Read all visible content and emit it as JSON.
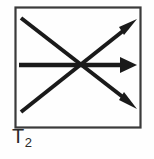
{
  "figure": {
    "title": "T2",
    "label": {
      "base": "T",
      "subscript": "2",
      "full": "T2"
    },
    "colors": {
      "ink": "#1a1a1a",
      "frame": "#3a3a3a",
      "background": "#fefefe",
      "label": "#2a2a2a"
    },
    "frame": {
      "x": 15,
      "y": 7,
      "width": 126,
      "height": 121,
      "stroke_width": 2.2
    },
    "convergence_point": {
      "x": 78,
      "y": 65
    },
    "arrows": [
      {
        "name": "arrow-up-right",
        "direction": "up-right",
        "x1": 21,
        "y1": 112,
        "x2": 136,
        "y2": 20,
        "head": "filled-triangle"
      },
      {
        "name": "arrow-right",
        "direction": "right",
        "x1": 19,
        "y1": 65,
        "x2": 137,
        "y2": 65,
        "head": "filled-triangle"
      },
      {
        "name": "arrow-down-right",
        "direction": "down-right",
        "x1": 21,
        "y1": 18,
        "x2": 136,
        "y2": 108,
        "head": "filled-triangle"
      }
    ]
  }
}
